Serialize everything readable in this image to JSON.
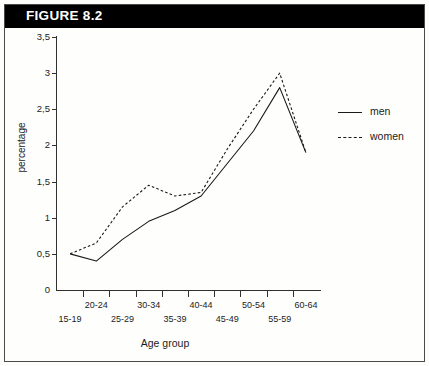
{
  "figure": {
    "label": "FIGURE 8.2"
  },
  "chart_data": {
    "type": "line",
    "title": "",
    "xlabel": "Age group",
    "ylabel": "percentage",
    "categories": [
      "15-19",
      "20-24",
      "25-29",
      "30-34",
      "35-39",
      "40-44",
      "45-49",
      "50-54",
      "55-59",
      "60-64"
    ],
    "series": [
      {
        "name": "men",
        "style": "solid",
        "color": "#1a1a1a",
        "values": [
          0.5,
          0.4,
          0.7,
          0.95,
          1.1,
          1.3,
          1.75,
          2.2,
          2.8,
          1.9
        ]
      },
      {
        "name": "women",
        "style": "dotted",
        "color": "#1a1a1a",
        "values": [
          0.5,
          0.65,
          1.15,
          1.45,
          1.3,
          1.35,
          1.95,
          2.5,
          3.0,
          1.9
        ]
      }
    ],
    "ylim": [
      0,
      3.5
    ],
    "ytick_labels": [
      "0",
      "0,5",
      "1",
      "1,5",
      "2",
      "2,5",
      "3",
      "3,5"
    ],
    "ytick_values": [
      0,
      0.5,
      1,
      1.5,
      2,
      2.5,
      3,
      3.5
    ],
    "grid": false,
    "legend_position": "right",
    "legend_entries": [
      "men",
      "women"
    ]
  }
}
